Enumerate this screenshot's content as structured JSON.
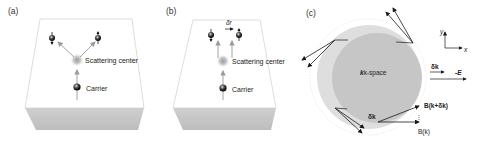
{
  "panels": [
    {
      "id": "a",
      "label": "(a)",
      "scattering_center_label": "Scattering center",
      "carrier_label": "Carrier"
    },
    {
      "id": "b",
      "label": "(b)",
      "scattering_center_label": "Scattering center",
      "carrier_label": "Carrier",
      "shift_label": "δr"
    },
    {
      "id": "c",
      "label": "(c)",
      "kspace_label": "k-space",
      "axis_y_label": "y",
      "axis_x_label": "x",
      "delta_k_label": "δk",
      "field_label": "-E",
      "dk_bottom_label": "δk",
      "b_shifted_label": "B(k+δk)",
      "b_label": "B(k)"
    }
  ],
  "colors": {
    "box_top": "#ffffff",
    "box_edge": "#d0d0d0",
    "box_side": "#c4c4c4",
    "kspace_inner": "#c6c6c6",
    "kspace_outer": "#dedede",
    "arrow_gray": "#9a9a9a",
    "arrow_dark": "#1a1a1a"
  }
}
